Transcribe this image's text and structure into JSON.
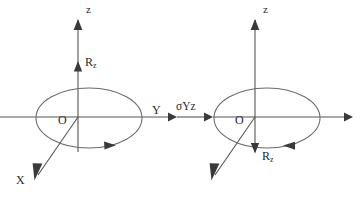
{
  "figure": {
    "type": "symmetry-operation-diagram",
    "background_color": "#ffffff",
    "line_color": "#555555",
    "label_color": "#2b2b2b",
    "operator": {
      "label": "σYz",
      "name": "sigma-yz-mirror-plane",
      "arrow_direction": "right"
    },
    "panels": [
      {
        "id": "before",
        "name": "left-diagram",
        "origin_label": "O",
        "axes": [
          {
            "name": "z-axis",
            "label": "z",
            "direction": "up",
            "arrow": true
          },
          {
            "name": "y-axis",
            "label": "Y",
            "direction": "right",
            "arrow": true
          },
          {
            "name": "x-axis",
            "label": "X",
            "direction": "down-left",
            "arrow": true
          }
        ],
        "vector": {
          "name": "rz-vector",
          "label": "R",
          "subscript": "z",
          "direction": "up"
        },
        "rotation": {
          "name": "rotation-sense",
          "direction": "clockwise",
          "arrow_points": "right"
        },
        "ellipse": {
          "name": "rotation-ellipse",
          "center_x": 89,
          "center_y": 118,
          "radius_x": 53,
          "radius_y": 30
        }
      },
      {
        "id": "after",
        "name": "right-diagram",
        "origin_label": "O",
        "axes": [
          {
            "name": "z-axis",
            "label": "z",
            "direction": "up",
            "arrow": true
          },
          {
            "name": "y-axis",
            "label": "",
            "direction": "right",
            "arrow": true
          },
          {
            "name": "x-axis",
            "label": "",
            "direction": "down-left",
            "arrow": true
          }
        ],
        "vector": {
          "name": "rz-vector",
          "label": "R",
          "subscript": "z",
          "direction": "down"
        },
        "rotation": {
          "name": "rotation-sense",
          "direction": "counter-clockwise",
          "arrow_points": "left"
        },
        "ellipse": {
          "name": "rotation-ellipse",
          "center_x": 267,
          "center_y": 118,
          "radius_x": 53,
          "radius_y": 30
        }
      }
    ]
  }
}
